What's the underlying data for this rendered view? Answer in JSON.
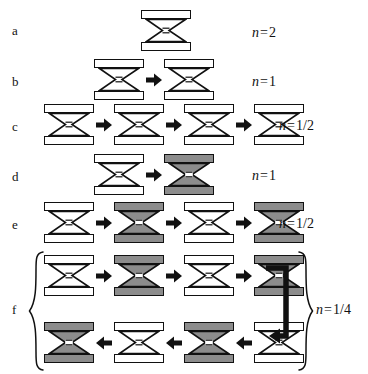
{
  "figure": {
    "type": "diagram",
    "background_color": "#ffffff",
    "ink_color": "#111111",
    "fill_white": "#ffffff",
    "fill_gray": "#8c8c8c"
  },
  "rows": [
    {
      "label": "a",
      "n_label": {
        "variable": "n",
        "equals": "=",
        "value": "2",
        "full": "n = 2"
      },
      "count": 1,
      "states": [
        "white"
      ],
      "arrows": [],
      "arrow_direction": "right"
    },
    {
      "label": "b",
      "n_label": {
        "variable": "n",
        "equals": "=",
        "value": "1",
        "full": "n = 1"
      },
      "count": 2,
      "states": [
        "white",
        "white"
      ],
      "arrows": [
        "right"
      ],
      "arrow_direction": "right"
    },
    {
      "label": "c",
      "n_label": {
        "variable": "n",
        "equals": "=",
        "value": "1/2",
        "full": "n = 1/2"
      },
      "count": 4,
      "states": [
        "white",
        "white",
        "white",
        "white"
      ],
      "arrows": [
        "right",
        "right",
        "right"
      ],
      "arrow_direction": "right"
    },
    {
      "label": "d",
      "n_label": {
        "variable": "n",
        "equals": "=",
        "value": "1",
        "full": "n = 1"
      },
      "count": 2,
      "states": [
        "white",
        "gray"
      ],
      "arrows": [
        "right"
      ],
      "arrow_direction": "right"
    },
    {
      "label": "e",
      "n_label": {
        "variable": "n",
        "equals": "=",
        "value": "1/2",
        "full": "n = 1/2"
      },
      "count": 4,
      "states": [
        "white",
        "gray",
        "white",
        "gray"
      ],
      "arrows": [
        "right",
        "right",
        "right"
      ],
      "arrow_direction": "right"
    },
    {
      "label": "f",
      "n_label": {
        "variable": "n",
        "equals": "=",
        "value": "1/4",
        "full": "n = 1/4"
      },
      "count": 8,
      "subrows": [
        {
          "states": [
            "white",
            "gray",
            "white",
            "gray"
          ],
          "arrows": [
            "right",
            "right",
            "right"
          ],
          "arrow_direction": "right"
        },
        {
          "states": [
            "gray",
            "white",
            "gray",
            "white"
          ],
          "arrows": [
            "left",
            "left",
            "left"
          ],
          "arrow_direction": "left"
        }
      ],
      "has_brace": true,
      "has_feedback_connector": true,
      "feedback_connector": "wraps from end of top subrow down and left into end of bottom subrow"
    }
  ]
}
